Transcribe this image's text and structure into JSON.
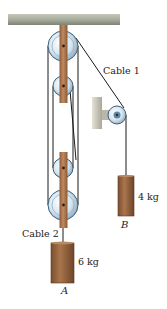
{
  "diagram": {
    "title": "",
    "labels": {
      "cable1": "Cable 1",
      "cable2": "Cable 2",
      "mass_a": "6 kg",
      "mass_b": "4 kg",
      "block_a": "A",
      "block_b": "B"
    },
    "components": [
      {
        "id": "ceiling",
        "type": "fixed-support"
      },
      {
        "id": "upper-block",
        "type": "fixed-pulley-block",
        "pulleys": 2
      },
      {
        "id": "lower-block",
        "type": "movable-pulley-block",
        "pulleys": 2
      },
      {
        "id": "wall-pulley",
        "type": "fixed-pulley",
        "mount": "wall-bracket"
      },
      {
        "id": "block-a",
        "type": "mass",
        "label": "A",
        "mass": "6 kg",
        "hangs_from": "lower-block via Cable 2"
      },
      {
        "id": "block-b",
        "type": "mass",
        "label": "B",
        "mass": "4 kg",
        "hangs_from": "Cable 1 over wall-pulley"
      }
    ],
    "colors": {
      "ceiling": "#a9ad9e",
      "bracket_wood": "#b07a52",
      "mass_wood": "#9b6a45",
      "pulley": "#cfe3ef",
      "pulley_edge": "#3f5e75",
      "wall_mount": "#c9c7b8",
      "rope": "#1a1a1a"
    }
  }
}
